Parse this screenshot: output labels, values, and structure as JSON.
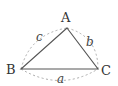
{
  "diagram": {
    "title": "",
    "type": "triangle",
    "vertices": [
      {
        "id": "A",
        "label": "A",
        "x": 67,
        "y": 28
      },
      {
        "id": "B",
        "label": "B",
        "x": 21,
        "y": 69
      },
      {
        "id": "C",
        "label": "C",
        "x": 98,
        "y": 69
      }
    ],
    "sides": [
      {
        "id": "a",
        "label": "a",
        "from": "B",
        "to": "C"
      },
      {
        "id": "b",
        "label": "b",
        "from": "A",
        "to": "C"
      },
      {
        "id": "c",
        "label": "c",
        "from": "B",
        "to": "A"
      }
    ],
    "colors": {
      "triangle_stroke": "#555555",
      "arc_stroke": "#aaaaaa",
      "text": "#333333",
      "background": "#ffffff"
    }
  }
}
